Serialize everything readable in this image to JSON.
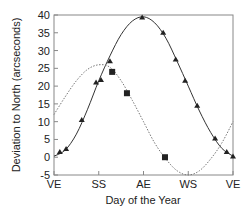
{
  "chart_data": {
    "type": "scatter",
    "title": "",
    "xlabel": "Day of the Year",
    "ylabel": "Deviation to North (arcseconds)",
    "x_ticks": [
      "VE",
      "SS",
      "AE",
      "WS",
      "VE"
    ],
    "x_tick_positions": [
      0,
      1,
      2,
      3,
      4
    ],
    "xlim": [
      0,
      4
    ],
    "y_ticks": [
      -5,
      0,
      5,
      10,
      15,
      20,
      25,
      30,
      35,
      40
    ],
    "ylim": [
      -5,
      40
    ],
    "grid": false,
    "legend": "none",
    "series": [
      {
        "name": "triangles",
        "marker": "triangle",
        "x": [
          0.13,
          0.27,
          0.62,
          0.94,
          1.05,
          1.25,
          1.97,
          2.44,
          2.72,
          2.93,
          3.2,
          3.6,
          3.86,
          4.0
        ],
        "y": [
          1.5,
          2.3,
          10.5,
          21.0,
          21.7,
          27.0,
          39.3,
          35.0,
          27.5,
          21.5,
          14.5,
          5.3,
          1.5,
          0.2
        ]
      },
      {
        "name": "squares",
        "marker": "square",
        "x": [
          1.3,
          1.63,
          2.48
        ],
        "y": [
          24.0,
          18.0,
          0.0
        ]
      },
      {
        "name": "solid fit",
        "style": "solid",
        "x": [
          0,
          0.25,
          0.5,
          0.75,
          1.0,
          1.25,
          1.5,
          1.75,
          2.0,
          2.25,
          2.5,
          2.75,
          3.0,
          3.25,
          3.5,
          3.75,
          4.0
        ],
        "y": [
          0.3,
          2.0,
          6.5,
          13.5,
          21.5,
          28.5,
          34.5,
          38.3,
          39.5,
          37.8,
          33.5,
          27.0,
          20.0,
          13.0,
          7.0,
          2.5,
          0.3
        ]
      },
      {
        "name": "dotted fit",
        "style": "dotted",
        "x": [
          0,
          0.25,
          0.5,
          0.75,
          1.0,
          1.25,
          1.5,
          1.75,
          2.0,
          2.25,
          2.5,
          2.75,
          3.0,
          3.25,
          3.5,
          3.75,
          4.0
        ],
        "y": [
          12.0,
          17.0,
          21.5,
          24.7,
          26.0,
          25.3,
          21.5,
          16.0,
          10.0,
          4.0,
          -0.5,
          -3.8,
          -5.0,
          -3.8,
          -0.5,
          4.0,
          10.0
        ]
      }
    ]
  },
  "colors": {
    "axis": "#888888",
    "line": "#333333",
    "marker": "#222222",
    "dotted": "#777777"
  }
}
